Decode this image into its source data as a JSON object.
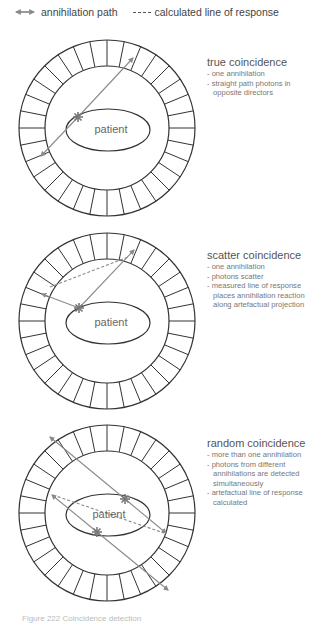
{
  "legend": {
    "items": [
      {
        "icon": "double-arrow-icon",
        "label": "annihilation path"
      },
      {
        "icon": "dashed-line-icon",
        "label": "calculated line of response"
      }
    ]
  },
  "colors": {
    "ring_stroke": "#333333",
    "path_stroke": "#8a8a8a",
    "text": "#666666"
  },
  "panels": [
    {
      "title": "true coincidence",
      "patient_label": "patient",
      "bullets": [
        "- one annihilation",
        "- straight path photons in opposite directors"
      ]
    },
    {
      "title": "scatter coincidence",
      "patient_label": "patient",
      "bullets": [
        "- one annihilation",
        "- photons scatter",
        "- measured line of response places annihilation reaction along artefactual projection"
      ]
    },
    {
      "title": "random coincidence",
      "patient_label": "patient",
      "bullets": [
        "- more than one annihilation",
        "- photons from different annihilations are detected simultaneously",
        "- artefactual line of response calculated"
      ]
    }
  ],
  "caption": "Figure 222 Coincidence detection"
}
